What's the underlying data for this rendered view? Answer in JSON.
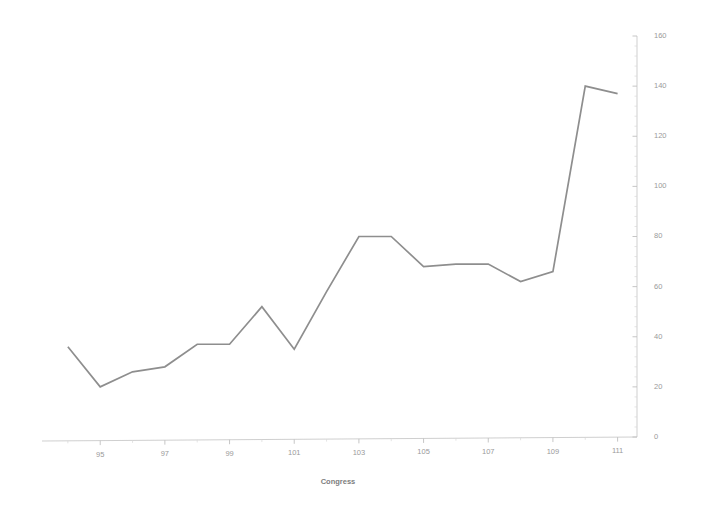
{
  "chart_data": {
    "type": "line",
    "title": "",
    "subtitle": "",
    "xlabel": "Congress",
    "ylabel": "",
    "x": [
      94,
      95,
      96,
      97,
      98,
      99,
      100,
      101,
      102,
      103,
      104,
      105,
      106,
      107,
      108,
      109,
      110,
      111
    ],
    "values": [
      36,
      20,
      26,
      28,
      37,
      37,
      52,
      35,
      58,
      80,
      80,
      68,
      69,
      69,
      62,
      66,
      140,
      137
    ],
    "series": [
      {
        "name": "Congress series",
        "values": [
          36,
          20,
          26,
          28,
          37,
          37,
          52,
          35,
          58,
          80,
          80,
          68,
          69,
          69,
          62,
          66,
          140,
          137
        ]
      }
    ],
    "xlim": [
      93.2,
      111.6
    ],
    "ylim": [
      0,
      160
    ],
    "x_tick_labels": [
      "95",
      "97",
      "99",
      "101",
      "103",
      "105",
      "107",
      "109",
      "111"
    ],
    "x_tick_values": [
      95,
      97,
      99,
      101,
      103,
      105,
      107,
      109,
      111
    ],
    "y_tick_labels": [
      "0",
      "20",
      "40",
      "60",
      "80",
      "100",
      "120",
      "140",
      "160"
    ],
    "y_tick_values": [
      0,
      20,
      40,
      60,
      80,
      100,
      120,
      140,
      160
    ],
    "y_axis_position": "right",
    "grid": false,
    "legend": "none",
    "line_color": "#8e8e8e",
    "axis_color": "#c9c9c9",
    "background_color": "#ffffff"
  },
  "axis_titles": {
    "x": "Congress"
  }
}
